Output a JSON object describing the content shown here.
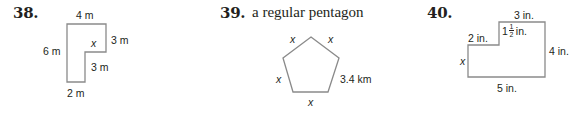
{
  "problems": [
    {
      "number": "38.",
      "shape": "L-shaped polygon",
      "labels": {
        "top": "4 m",
        "left": "6 m",
        "right_upper": "3 m",
        "inner": "x",
        "right_lower": "3 m",
        "bottom": "2 m"
      }
    },
    {
      "number": "39.",
      "title": "a regular pentagon",
      "shape": "pentagon",
      "labels": {
        "top_left": "x",
        "top_right": "x",
        "left": "x",
        "right": "3.4 km",
        "bottom": "x"
      }
    },
    {
      "number": "40.",
      "shape": "stepped polygon",
      "labels": {
        "top": "3 in.",
        "step_top": "2 in.",
        "step_height_whole": "1",
        "step_height_num": "1",
        "step_height_den": "2",
        "step_height_unit": "in.",
        "left": "x",
        "right": "4 in.",
        "bottom": "5 in."
      }
    }
  ],
  "colors": {
    "stroke": "#8a8a8a",
    "text": "#231f20"
  }
}
